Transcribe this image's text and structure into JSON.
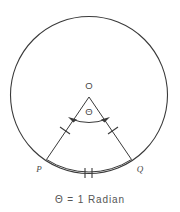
{
  "figure": {
    "stroke_color": "#3a3a3a",
    "text_color": "#4a4a4a",
    "background_color": "#ffffff",
    "center_label": "O",
    "point_p_label": "P",
    "point_q_label": "Q",
    "angle_label": "Θ",
    "caption": "Θ = 1 Radian",
    "geometry": {
      "circle_center_x": 89,
      "circle_center_y": 95,
      "circle_radius": 79,
      "apex_x": 89,
      "apex_y": 95,
      "point_p_x": 46,
      "point_p_y": 160,
      "point_q_x": 132,
      "point_q_y": 160,
      "angle_degrees": 57.3
    },
    "marks": {
      "radius_tick_count": 1,
      "arc_tick_count": 2,
      "angle_arrow": "double-headed"
    }
  }
}
